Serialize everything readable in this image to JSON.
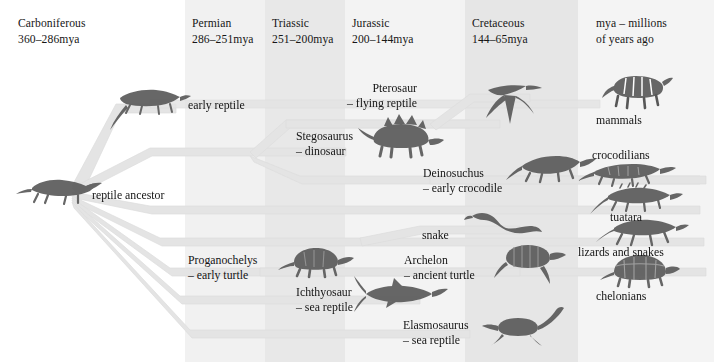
{
  "diagram": {
    "note_label": "mya – millions",
    "note_label2": "of years ago"
  },
  "periods": [
    {
      "name": "Carboniferous",
      "years": "360–286mya",
      "x": 18
    },
    {
      "name": "Permian",
      "years": "286–251mya",
      "x": 192
    },
    {
      "name": "Triassic",
      "years": "251–200mya",
      "x": 272
    },
    {
      "name": "Jurassic",
      "years": "200–144mya",
      "x": 352
    },
    {
      "name": "Cretaceous",
      "years": "144–65mya",
      "x": 472
    },
    {
      "name": "mya – millions",
      "years": "of years ago",
      "x": 596
    }
  ],
  "bands": [
    {
      "x": 0,
      "w": 185,
      "color": "#ffffff"
    },
    {
      "x": 185,
      "w": 80,
      "color": "#f1f1f1"
    },
    {
      "x": 265,
      "w": 80,
      "color": "#e8e8e8"
    },
    {
      "x": 345,
      "w": 120,
      "color": "#f3f3f3"
    },
    {
      "x": 465,
      "w": 113,
      "color": "#e6e6e6"
    },
    {
      "x": 578,
      "w": 136,
      "color": "#f4f4f4"
    }
  ],
  "taxa": [
    {
      "id": "reptile-ancestor",
      "l1": "reptile ancestor",
      "l2": "",
      "x": 92,
      "y": 188,
      "align": "left"
    },
    {
      "id": "early-reptile",
      "l1": "early reptile",
      "l2": "",
      "x": 188,
      "y": 98,
      "align": "left"
    },
    {
      "id": "pterosaur",
      "l1": "Pterosaur",
      "l2": "– flying reptile",
      "x": 417,
      "y": 81,
      "align": "right"
    },
    {
      "id": "stegosaurus",
      "l1": "Stegosaurus",
      "l2": "– dinosaur",
      "x": 296,
      "y": 129,
      "align": "left"
    },
    {
      "id": "deinosuchus",
      "l1": "Deinosuchus",
      "l2": "– early crocodile",
      "x": 423,
      "y": 166,
      "align": "left"
    },
    {
      "id": "snake",
      "l1": "snake",
      "l2": "",
      "x": 422,
      "y": 228,
      "align": "left"
    },
    {
      "id": "proganochelys",
      "l1": "Proganochelys",
      "l2": "– early turtle",
      "x": 188,
      "y": 253,
      "align": "left"
    },
    {
      "id": "archelon",
      "l1": "Archelon",
      "l2": "– ancient turtle",
      "x": 404,
      "y": 253,
      "align": "left"
    },
    {
      "id": "ichthyosaur",
      "l1": "Ichthyosaur",
      "l2": "– sea reptile",
      "x": 296,
      "y": 285,
      "align": "left"
    },
    {
      "id": "elasmosaurus",
      "l1": "Elasmosaurus",
      "l2": "– sea reptile",
      "x": 403,
      "y": 318,
      "align": "left"
    }
  ],
  "modern_groups": [
    {
      "id": "mammals",
      "label": "mammals",
      "x": 596,
      "y": 113
    },
    {
      "id": "crocodilians",
      "label": "crocodilians",
      "x": 592,
      "y": 148
    },
    {
      "id": "tuatara",
      "label": "tuatara",
      "x": 610,
      "y": 210
    },
    {
      "id": "lizards-and-snakes",
      "label": "lizards and snakes",
      "x": 578,
      "y": 245
    },
    {
      "id": "chelonians",
      "label": "chelonians",
      "x": 596,
      "y": 289
    }
  ],
  "colors": {
    "branch": "#e3e3e3",
    "branch_edge": "#d4d4d4",
    "text": "#141414",
    "band_light": "#f4f4f4",
    "band_mid": "#e8e8e8",
    "background": "#ffffff"
  },
  "organism_icons": [
    {
      "id": "reptile-ancestor-icon",
      "name": "lizard-silhouette-icon",
      "x": 28,
      "y": 175
    },
    {
      "id": "early-reptile-icon",
      "name": "lizard-silhouette-icon",
      "x": 112,
      "y": 88
    },
    {
      "id": "pterosaur-icon",
      "name": "pterosaur-silhouette-icon",
      "x": 488,
      "y": 86
    },
    {
      "id": "stegosaurus-icon",
      "name": "stegosaurus-silhouette-icon",
      "x": 370,
      "y": 122
    },
    {
      "id": "deinosuchus-icon",
      "name": "crocodile-silhouette-icon",
      "x": 520,
      "y": 152
    },
    {
      "id": "snake-icon",
      "name": "snake-silhouette-icon",
      "x": 474,
      "y": 214
    },
    {
      "id": "proganochelys-icon",
      "name": "turtle-silhouette-icon",
      "x": 288,
      "y": 248
    },
    {
      "id": "archelon-icon",
      "name": "sea-turtle-silhouette-icon",
      "x": 498,
      "y": 248
    },
    {
      "id": "ichthyosaur-icon",
      "name": "ichthyosaur-silhouette-icon",
      "x": 362,
      "y": 283
    },
    {
      "id": "elasmosaurus-icon",
      "name": "plesiosaur-silhouette-icon",
      "x": 486,
      "y": 316
    },
    {
      "id": "tiger-icon",
      "name": "tiger-silhouette-icon",
      "x": 608,
      "y": 76
    },
    {
      "id": "crocodilian-icon",
      "name": "crocodile-silhouette-icon",
      "x": 590,
      "y": 163
    },
    {
      "id": "tuatara-icon",
      "name": "tuatara-silhouette-icon",
      "x": 600,
      "y": 186
    },
    {
      "id": "lizard-icon",
      "name": "lizard-silhouette-icon",
      "x": 604,
      "y": 218
    },
    {
      "id": "tortoise-icon",
      "name": "tortoise-silhouette-icon",
      "x": 608,
      "y": 258
    }
  ]
}
